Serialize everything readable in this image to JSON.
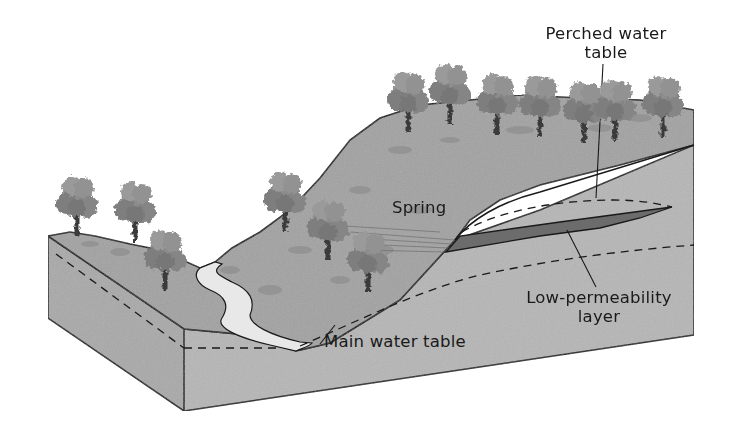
{
  "figure": {
    "colors": {
      "front_face": "#b4b4b4",
      "side_face": "#a9a9a9",
      "ground_surface": "#9e9e9e",
      "low_perm_layer": "#6c6c6c",
      "stream": "#e6e6e6",
      "outline": "#1a1a1a",
      "text": "#1a1a1a",
      "tree_canopy": "#8a8a8a",
      "tree_trunk": "#3a3a3a"
    }
  },
  "labels": {
    "perched_line1": "Perched water",
    "perched_line2": "table",
    "spring": "Spring",
    "low_perm_line1": "Low-permeability",
    "low_perm_line2": "layer",
    "main_water_table": "Main water table"
  }
}
